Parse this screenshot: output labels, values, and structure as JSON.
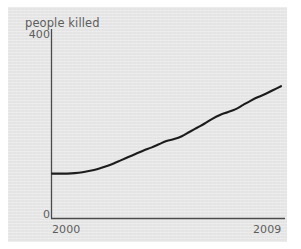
{
  "chart_data": {
    "type": "line",
    "title": "people killed",
    "xlabel": "",
    "ylabel": "people killed",
    "xlim": [
      2000,
      2009
    ],
    "ylim": [
      0,
      400
    ],
    "x_ticks": [
      "2000",
      "2009"
    ],
    "y_ticks": [
      "0",
      "400"
    ],
    "grid": false,
    "legend": null,
    "series": [
      {
        "name": "people killed",
        "color": "#1c1c1c",
        "x": [
          2000.0,
          2000.3,
          2000.6,
          2000.9,
          2001.2,
          2001.5,
          2001.8,
          2002.1,
          2002.4,
          2002.7,
          2003.0,
          2003.3,
          2003.6,
          2003.9,
          2004.2,
          2004.5,
          2004.8,
          2005.1,
          2005.4,
          2005.7,
          2006.0,
          2006.3,
          2006.6,
          2006.9,
          2007.2,
          2007.5,
          2007.8,
          2008.1,
          2008.4,
          2008.7,
          2009.0
        ],
        "values": [
          95,
          95,
          95,
          96,
          98,
          101,
          105,
          110,
          116,
          123,
          130,
          137,
          144,
          150,
          157,
          164,
          168,
          174,
          183,
          192,
          201,
          211,
          219,
          225,
          231,
          240,
          249,
          257,
          264,
          272,
          280
        ]
      }
    ],
    "annotations": []
  },
  "axes": {
    "y_axis_top_label": "400",
    "y_axis_bottom_label": "0",
    "x_axis_left_label": "2000",
    "x_axis_right_label": "2009",
    "axis_color": "#4a4a4a"
  },
  "colors": {
    "panel_background": "#e4e4e4",
    "page_background": "#ffffff",
    "line": "#1c1c1c",
    "text": "#5d5d5d"
  }
}
